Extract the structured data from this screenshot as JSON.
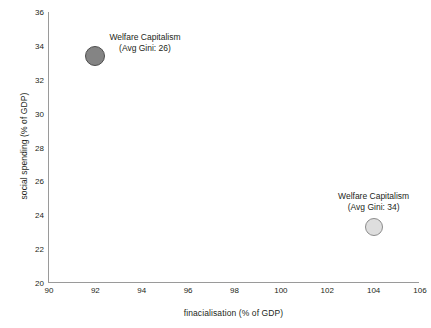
{
  "chart_data": {
    "type": "scatter",
    "title": "",
    "xlabel": "finacialisation (% of GDP)",
    "ylabel": "social spending (% of GDP)",
    "xlim": [
      90,
      106
    ],
    "ylim": [
      20,
      36
    ],
    "xticks": [
      90,
      92,
      94,
      96,
      98,
      100,
      102,
      104,
      106
    ],
    "yticks": [
      20,
      22,
      24,
      26,
      28,
      30,
      32,
      34,
      36
    ],
    "grid": false,
    "legend": "none",
    "background_color": "#ffffff",
    "axis_color": "#9a9a9a",
    "points": [
      {
        "name": "Welfare Capitalism (Avg Gini: 26)",
        "label_line1": "Welfare Capitalism",
        "label_line2": "(Avg Gini: 26)",
        "x": 92,
        "y": 33.4,
        "avg_gini": 26,
        "marker_radius_px": 10,
        "fill_color": "#848484",
        "border_color": "#4d4d4d"
      },
      {
        "name": "Welfare Capitalism (Avg Gini: 34)",
        "label_line1": "Welfare Capitalism",
        "label_line2": "(Avg Gini: 34)",
        "x": 104,
        "y": 23.3,
        "avg_gini": 34,
        "marker_radius_px": 9,
        "fill_color": "#dedede",
        "border_color": "#8c8c8c"
      }
    ]
  }
}
